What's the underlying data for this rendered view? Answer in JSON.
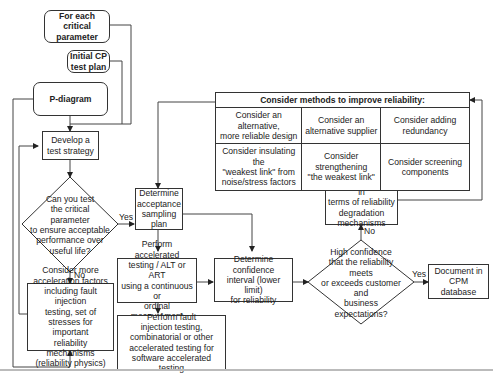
{
  "diagram": {
    "nodes": {
      "for_each": "For each\ncritical parameter",
      "initial_cp": "Initial CP\ntest plan",
      "p_diagram": "P-diagram",
      "develop_strategy": "Develop a\ntest strategy",
      "decision_test": "Can you test\nthe critical parameter\nto ensure acceptable\nperformance over\nuseful life?",
      "consider_more": "Consider more\nacceleration factors\nincluding fault injection\ntesting, set of\nstresses for\nimportant\nreliability mechanisms\n(reliability physics)",
      "determine_acceptance": "Determine\nacceptance\nsampling plan",
      "perform_accelerated": "Perform accelerated\ntesting / ALT or ART\nusing a continuous or\nordinal measurement",
      "perform_fault": "Perform fault\ninjection testing,\ncombinatorial or other\naccelerated testing for\nsoftware accelerated testing",
      "determine_confidence": "Determine\nconfidence\ninterval (lower limit)\nfor reliability",
      "decision_confidence": "High confidence\nthat the reliability meets\nor exceeds customer and\nbusiness\nexpectations?",
      "document_cpm": "Document in\nCPM\ndatabase",
      "analyze_failures": "Analyze failures in\nterms of reliability\ndegradation\nmechanisms"
    },
    "methods_table": {
      "title": "Consider methods to improve reliability:",
      "rows": [
        [
          "Consider an alternative,\nmore reliable design",
          "Consider an\nalternative supplier",
          "Consider adding\nredundancy"
        ],
        [
          "Consider insulating the\n\"weakest link\" from\nnoise/stress factors",
          "Consider\nstrengthening\n\"the weakest link\"",
          "Consider screening\ncomponents"
        ]
      ]
    },
    "edge_labels": {
      "yes_1": "Yes",
      "no_1": "No",
      "yes_2": "Yes",
      "no_2": "No"
    }
  }
}
